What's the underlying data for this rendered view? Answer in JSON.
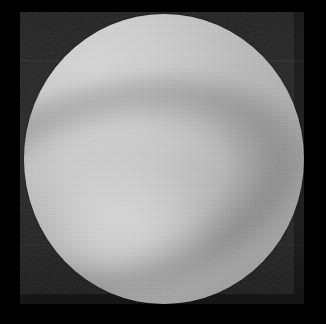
{
  "image": {
    "kind": "grayscale-scientific-image",
    "title": "Grayscale circular specimen",
    "description": "Monochrome circular bright object on a dark noisy background, framed by a black border.",
    "width_px": 326,
    "height_px": 324,
    "colorspace": "grayscale",
    "visible_text": ""
  },
  "frame": {
    "name": "black-letterbox-border",
    "color": "#000000",
    "left_px": 20,
    "top_px": 12,
    "right_px": 22,
    "bottom_px": 20
  },
  "background_field": {
    "name": "dark-noise-field",
    "color": "#1e1e1e",
    "color_light": "#232323",
    "color_dark": "#151515",
    "texture": "fine-sensor-noise",
    "bands_visible": 3
  },
  "disc": {
    "name": "bright-circular-specimen",
    "shape": "circle",
    "center_x_px": 164,
    "center_y_px": 159,
    "radius_x_px": 140,
    "radius_y_px": 145,
    "bounds": {
      "left_px": 24,
      "top_px": 14,
      "right_px": 304,
      "bottom_px": 304
    },
    "highlight_color": "#d8d8d8",
    "midtone_color": "#b4b4b4",
    "shadow_color": "#9d9d9d",
    "illumination_origin": "upper-left"
  },
  "features": [
    {
      "name": "caustic-dark-band",
      "label": "Dark curved band",
      "quadrant": "lower-left",
      "orientation_deg": -14,
      "color": "#8c8c8c"
    },
    {
      "name": "caustic-bright-lobe",
      "label": "Bright lobe",
      "quadrant": "lower-centre",
      "orientation_deg": 12,
      "color": "#e2e2e2"
    },
    {
      "name": "bright-streak",
      "label": "Bright streak",
      "quadrant": "left",
      "orientation_deg": -26,
      "color": "#dcdcdc"
    }
  ]
}
